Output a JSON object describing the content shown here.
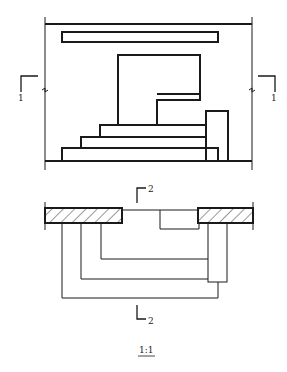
{
  "drawing": {
    "section_1_label_left": "1",
    "section_1_label_right": "1",
    "section_2_label_top": "2",
    "section_2_label_bottom": "2",
    "scale": "1:1"
  },
  "colors": {
    "line": "#1a1a1a",
    "hatch": "#333333",
    "background": "#ffffff"
  }
}
